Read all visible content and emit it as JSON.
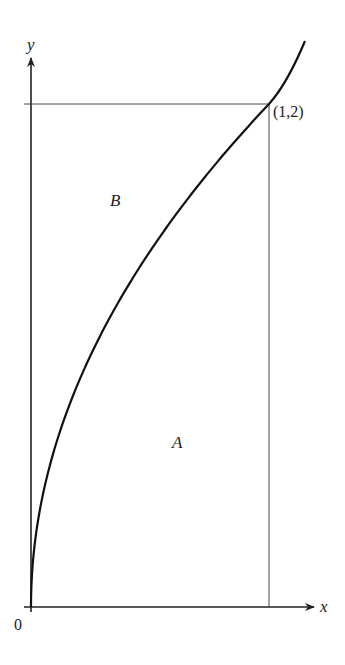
{
  "diagram": {
    "axes": {
      "x_label": "x",
      "y_label": "y",
      "origin_label": "0"
    },
    "point_label": "(1,2)",
    "region_labels": {
      "upper": "B",
      "lower": "A"
    },
    "curve": "y = 2√x",
    "colors": {
      "ink": "#222222",
      "background": "#ffffff"
    }
  }
}
